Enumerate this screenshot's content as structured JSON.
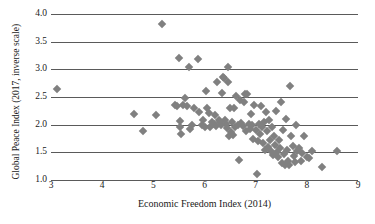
{
  "chart_data": {
    "type": "scatter",
    "title": "",
    "xlabel": "Economic Freedom Index (2014)",
    "ylabel": "Global Peace Index (2017, inverse scale)",
    "xlim": [
      3,
      9
    ],
    "ylim": [
      1.0,
      4.0
    ],
    "xticks": [
      "3",
      "4",
      "5",
      "6",
      "7",
      "8",
      "9"
    ],
    "yticks": [
      "1.0",
      "1.5",
      "2.0",
      "2.5",
      "3.0",
      "3.5",
      "4.0"
    ],
    "xtick_values": [
      3,
      4,
      5,
      6,
      7,
      8,
      9
    ],
    "ytick_values": [
      1.0,
      1.5,
      2.0,
      2.5,
      3.0,
      3.5,
      4.0
    ],
    "grid": "horizontal",
    "legend": "none",
    "marker": "diamond",
    "marker_color": "#808080",
    "gridline_color": "#5a5a5a",
    "points": [
      [
        3.12,
        2.65
      ],
      [
        4.62,
        2.2
      ],
      [
        4.8,
        1.89
      ],
      [
        5.05,
        2.18
      ],
      [
        5.17,
        3.82
      ],
      [
        5.42,
        2.36
      ],
      [
        5.47,
        2.34
      ],
      [
        5.5,
        3.21
      ],
      [
        5.52,
        2.06
      ],
      [
        5.53,
        1.95
      ],
      [
        5.55,
        1.83
      ],
      [
        5.58,
        2.36
      ],
      [
        5.62,
        2.49
      ],
      [
        5.66,
        2.34
      ],
      [
        5.7,
        3.05
      ],
      [
        5.72,
        1.92
      ],
      [
        5.75,
        2.0
      ],
      [
        5.8,
        2.3
      ],
      [
        5.88,
        3.18
      ],
      [
        5.9,
        2.23
      ],
      [
        5.95,
        1.99
      ],
      [
        5.97,
        2.08
      ],
      [
        6.0,
        1.96
      ],
      [
        6.03,
        2.61
      ],
      [
        6.05,
        2.3
      ],
      [
        6.08,
        2.21
      ],
      [
        6.1,
        1.95
      ],
      [
        6.15,
        2.04
      ],
      [
        6.18,
        2.02
      ],
      [
        6.2,
        2.17
      ],
      [
        6.22,
        1.98
      ],
      [
        6.25,
        2.78
      ],
      [
        6.28,
        2.08
      ],
      [
        6.3,
        2.05
      ],
      [
        6.32,
        2.0
      ],
      [
        6.35,
        2.57
      ],
      [
        6.36,
        2.86
      ],
      [
        6.38,
        2.84
      ],
      [
        6.4,
        2.09
      ],
      [
        6.42,
        2.02
      ],
      [
        6.44,
        1.94
      ],
      [
        6.45,
        3.04
      ],
      [
        6.46,
        2.78
      ],
      [
        6.48,
        1.79
      ],
      [
        6.5,
        2.31
      ],
      [
        6.52,
        1.86
      ],
      [
        6.54,
        2.04
      ],
      [
        6.56,
        1.82
      ],
      [
        6.58,
        2.3
      ],
      [
        6.6,
        1.95
      ],
      [
        6.62,
        2.52
      ],
      [
        6.65,
        2.0
      ],
      [
        6.68,
        1.37
      ],
      [
        6.7,
        2.45
      ],
      [
        6.72,
        2.03
      ],
      [
        6.75,
        1.97
      ],
      [
        6.78,
        2.41
      ],
      [
        6.8,
        2.55
      ],
      [
        6.82,
        1.88
      ],
      [
        6.84,
        2.56
      ],
      [
        6.86,
        2.01
      ],
      [
        6.88,
        1.93
      ],
      [
        6.9,
        2.2
      ],
      [
        6.92,
        2.0
      ],
      [
        6.95,
        1.74
      ],
      [
        6.97,
        2.36
      ],
      [
        7.0,
        1.9
      ],
      [
        7.02,
        1.11
      ],
      [
        7.04,
        1.7
      ],
      [
        7.06,
        2.02
      ],
      [
        7.08,
        1.83
      ],
      [
        7.1,
        2.34
      ],
      [
        7.12,
        1.95
      ],
      [
        7.14,
        1.66
      ],
      [
        7.16,
        2.05
      ],
      [
        7.18,
        1.55
      ],
      [
        7.2,
        2.22
      ],
      [
        7.22,
        1.88
      ],
      [
        7.24,
        1.6
      ],
      [
        7.26,
        2.08
      ],
      [
        7.28,
        1.73
      ],
      [
        7.3,
        1.52
      ],
      [
        7.32,
        1.96
      ],
      [
        7.34,
        1.45
      ],
      [
        7.36,
        1.8
      ],
      [
        7.38,
        1.63
      ],
      [
        7.4,
        2.25
      ],
      [
        7.42,
        1.5
      ],
      [
        7.44,
        1.41
      ],
      [
        7.46,
        1.72
      ],
      [
        7.48,
        1.58
      ],
      [
        7.5,
        2.41
      ],
      [
        7.52,
        1.3
      ],
      [
        7.54,
        1.9
      ],
      [
        7.56,
        1.47
      ],
      [
        7.58,
        1.27
      ],
      [
        7.6,
        2.1
      ],
      [
        7.62,
        1.55
      ],
      [
        7.64,
        1.35
      ],
      [
        7.66,
        1.28
      ],
      [
        7.68,
        2.7
      ],
      [
        7.7,
        1.8
      ],
      [
        7.72,
        1.62
      ],
      [
        7.74,
        1.44
      ],
      [
        7.76,
        1.32
      ],
      [
        7.78,
        2.0
      ],
      [
        7.8,
        1.53
      ],
      [
        7.85,
        1.58
      ],
      [
        7.88,
        1.34
      ],
      [
        7.9,
        1.48
      ],
      [
        7.95,
        1.79
      ],
      [
        8.0,
        1.42
      ],
      [
        8.05,
        1.4
      ],
      [
        8.1,
        1.52
      ],
      [
        8.3,
        1.24
      ],
      [
        8.58,
        1.53
      ]
    ]
  }
}
